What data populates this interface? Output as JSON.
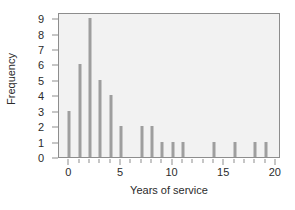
{
  "chart_data": {
    "type": "bar",
    "title": "",
    "subtitle": "",
    "xlabel": "Years of service",
    "ylabel": "Frequency",
    "xlim": [
      -1,
      20.5
    ],
    "ylim": [
      0,
      9.4
    ],
    "grid": false,
    "legend": null,
    "annotations": [],
    "bar_color": "#9e9e9e",
    "plot_background": "#f2f2f2",
    "figure_background": "#ffffff",
    "axis_color": "#8d8d8d",
    "text_color": "#2b2b2b",
    "x_major_ticks": [
      0,
      5,
      10,
      15,
      20
    ],
    "x_major_tick_labels": [
      "0",
      "5",
      "10",
      "15",
      "20"
    ],
    "x_minor_ticks": [
      1,
      2,
      3,
      4,
      6,
      7,
      8,
      9,
      11,
      12,
      13,
      14,
      16,
      17,
      18,
      19
    ],
    "y_ticks": [
      0,
      1,
      2,
      3,
      4,
      5,
      6,
      7,
      8,
      9
    ],
    "y_tick_labels": [
      "0",
      "1",
      "2",
      "3",
      "4",
      "5",
      "6",
      "7",
      "8",
      "9"
    ],
    "categories": [
      0,
      1,
      2,
      3,
      4,
      5,
      6,
      7,
      8,
      9,
      10,
      11,
      12,
      13,
      14,
      15,
      16,
      17,
      18,
      19,
      20
    ],
    "values": [
      3,
      6,
      9,
      5,
      4,
      2,
      0,
      2,
      2,
      1,
      1,
      1,
      0,
      0,
      1,
      0,
      1,
      0,
      1,
      1,
      0
    ],
    "points": [
      {
        "x": 0,
        "y": 3
      },
      {
        "x": 1,
        "y": 6
      },
      {
        "x": 2,
        "y": 9
      },
      {
        "x": 3,
        "y": 5
      },
      {
        "x": 4,
        "y": 4
      },
      {
        "x": 5,
        "y": 2
      },
      {
        "x": 7,
        "y": 2
      },
      {
        "x": 8,
        "y": 2
      },
      {
        "x": 9,
        "y": 1
      },
      {
        "x": 10,
        "y": 1
      },
      {
        "x": 11,
        "y": 1
      },
      {
        "x": 14,
        "y": 1
      },
      {
        "x": 16,
        "y": 1
      },
      {
        "x": 18,
        "y": 1
      },
      {
        "x": 19,
        "y": 1
      }
    ]
  }
}
